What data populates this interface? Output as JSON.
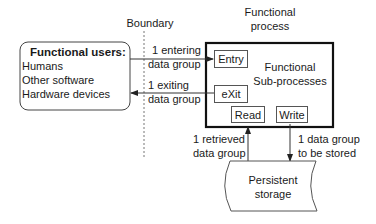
{
  "boundary": {
    "label": "Boundary"
  },
  "functional_users": {
    "title": "Functional users:",
    "items": [
      "Humans",
      "Other software",
      "Hardware devices"
    ]
  },
  "functional_process": {
    "label_line1": "Functional",
    "label_line2": "process",
    "sub_label_line1": "Functional",
    "sub_label_line2": "Sub-processes",
    "sub_processes": {
      "entry": "Entry",
      "exit": "eXit",
      "read": "Read",
      "write": "Write"
    }
  },
  "flows": {
    "entering_line1": "1 entering",
    "entering_line2": "data group",
    "exiting_line1": "1 exiting",
    "exiting_line2": "data group",
    "retrieved_line1": "1 retrieved",
    "retrieved_line2": "data group",
    "stored_line1": "1 data group",
    "stored_line2": "to be stored"
  },
  "storage": {
    "line1": "Persistent",
    "line2": "storage"
  }
}
